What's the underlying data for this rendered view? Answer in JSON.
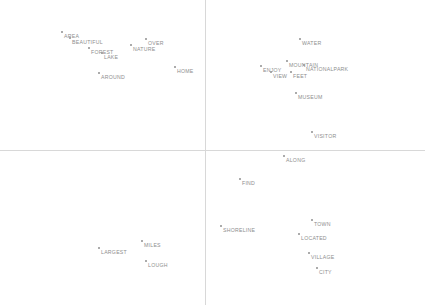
{
  "figure": {
    "width": 425,
    "height": 305,
    "background_color": "#ffffff",
    "axis_color": "#d8d8d8",
    "marker_color": "#9a9a9a",
    "label_color": "#8e8e8e",
    "axis_x_y": 150,
    "axis_y_x": 205
  },
  "chart_data": {
    "type": "scatter",
    "title": "",
    "xlabel": "",
    "ylabel": "",
    "xlim": [
      0,
      425
    ],
    "ylim": [
      305,
      0
    ],
    "grid": false,
    "legend": null,
    "axes": {
      "vertical_line_x": 205,
      "horizontal_line_y": 150
    },
    "points": [
      {
        "label": "AREA",
        "x": 62,
        "y": 32,
        "lx": 64,
        "ly": 34
      },
      {
        "label": "BEAUTIFUL",
        "x": 70,
        "y": 38,
        "lx": 72,
        "ly": 40
      },
      {
        "label": "FOREST",
        "x": 89,
        "y": 48,
        "lx": 91,
        "ly": 50
      },
      {
        "label": "LAKE",
        "x": 102,
        "y": 53,
        "lx": 104,
        "ly": 55
      },
      {
        "label": "NATURE",
        "x": 131,
        "y": 45,
        "lx": 133,
        "ly": 47
      },
      {
        "label": "OVER",
        "x": 146,
        "y": 39,
        "lx": 148,
        "ly": 41
      },
      {
        "label": "AROUND",
        "x": 99,
        "y": 73,
        "lx": 101,
        "ly": 75
      },
      {
        "label": "HOME",
        "x": 175,
        "y": 67,
        "lx": 177,
        "ly": 69
      },
      {
        "label": "WATER",
        "x": 300,
        "y": 39,
        "lx": 302,
        "ly": 41
      },
      {
        "label": "ENJOY",
        "x": 261,
        "y": 66,
        "lx": 263,
        "ly": 68
      },
      {
        "label": "MOUNTAIN",
        "x": 287,
        "y": 61,
        "lx": 289,
        "ly": 63
      },
      {
        "label": "NATIONALPARK",
        "x": 304,
        "y": 65,
        "lx": 306,
        "ly": 67
      },
      {
        "label": "VIEW",
        "x": 271,
        "y": 72,
        "lx": 273,
        "ly": 74
      },
      {
        "label": "FEET",
        "x": 291,
        "y": 72,
        "lx": 293,
        "ly": 74
      },
      {
        "label": "MUSEUM",
        "x": 296,
        "y": 93,
        "lx": 298,
        "ly": 95
      },
      {
        "label": "VISITOR",
        "x": 312,
        "y": 132,
        "lx": 314,
        "ly": 134
      },
      {
        "label": "ALONG",
        "x": 284,
        "y": 156,
        "lx": 286,
        "ly": 158
      },
      {
        "label": "FIND",
        "x": 240,
        "y": 179,
        "lx": 242,
        "ly": 181
      },
      {
        "label": "SHORELINE",
        "x": 221,
        "y": 226,
        "lx": 223,
        "ly": 228
      },
      {
        "label": "TOWN",
        "x": 312,
        "y": 220,
        "lx": 314,
        "ly": 222
      },
      {
        "label": "LOCATED",
        "x": 299,
        "y": 234,
        "lx": 301,
        "ly": 236
      },
      {
        "label": "VILLAGE",
        "x": 309,
        "y": 253,
        "lx": 311,
        "ly": 255
      },
      {
        "label": "CITY",
        "x": 317,
        "y": 268,
        "lx": 319,
        "ly": 270
      },
      {
        "label": "LARGEST",
        "x": 99,
        "y": 248,
        "lx": 101,
        "ly": 250
      },
      {
        "label": "MILES",
        "x": 142,
        "y": 241,
        "lx": 144,
        "ly": 243
      },
      {
        "label": "LOUGH",
        "x": 146,
        "y": 261,
        "lx": 148,
        "ly": 263
      }
    ]
  }
}
